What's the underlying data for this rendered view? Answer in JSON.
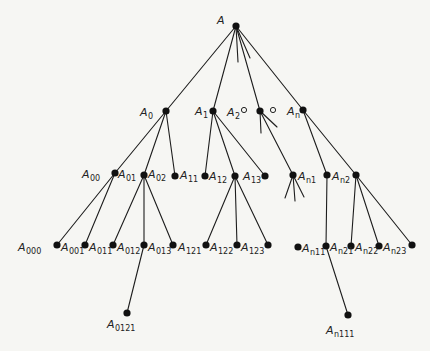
{
  "diagram": {
    "title": "",
    "colors": {
      "ink": "#1d1d1d",
      "node": "#111111",
      "background": "#f6f6f3"
    },
    "nodes": [
      {
        "id": "A",
        "x": 236,
        "y": 26,
        "type": "filled"
      },
      {
        "id": "A0",
        "x": 166,
        "y": 111,
        "type": "filled"
      },
      {
        "id": "A1",
        "x": 213,
        "y": 111,
        "type": "filled"
      },
      {
        "id": "A2-open",
        "x": 244,
        "y": 110,
        "type": "open"
      },
      {
        "id": "A2",
        "x": 260,
        "y": 111,
        "type": "filled"
      },
      {
        "id": "ellipsis-open",
        "x": 273,
        "y": 110,
        "type": "open"
      },
      {
        "id": "An",
        "x": 303,
        "y": 110,
        "type": "filled"
      },
      {
        "id": "A00-A01",
        "x": 115,
        "y": 173,
        "type": "filled"
      },
      {
        "id": "A02",
        "x": 144,
        "y": 175,
        "type": "filled"
      },
      {
        "id": "A11",
        "x": 175,
        "y": 176,
        "type": "filled"
      },
      {
        "id": "A12",
        "x": 205,
        "y": 176,
        "type": "filled"
      },
      {
        "id": "A13",
        "x": 235,
        "y": 176,
        "type": "filled"
      },
      {
        "id": "A14",
        "x": 265,
        "y": 176,
        "type": "filled"
      },
      {
        "id": "An1",
        "x": 293,
        "y": 175,
        "type": "filled"
      },
      {
        "id": "An2a",
        "x": 327,
        "y": 175,
        "type": "filled"
      },
      {
        "id": "An2",
        "x": 356,
        "y": 175,
        "type": "filled"
      },
      {
        "id": "A000",
        "x": 57,
        "y": 245,
        "type": "filled"
      },
      {
        "id": "A001",
        "x": 85,
        "y": 245,
        "type": "filled"
      },
      {
        "id": "A011",
        "x": 113,
        "y": 245,
        "type": "filled"
      },
      {
        "id": "A012",
        "x": 144,
        "y": 245,
        "type": "filled"
      },
      {
        "id": "A013",
        "x": 173,
        "y": 245,
        "type": "filled"
      },
      {
        "id": "A121",
        "x": 206,
        "y": 245,
        "type": "filled"
      },
      {
        "id": "A122",
        "x": 237,
        "y": 245,
        "type": "filled"
      },
      {
        "id": "A123",
        "x": 268,
        "y": 245,
        "type": "filled"
      },
      {
        "id": "An11",
        "x": 298,
        "y": 247,
        "type": "filled"
      },
      {
        "id": "An21",
        "x": 326,
        "y": 246,
        "type": "filled"
      },
      {
        "id": "An22",
        "x": 351,
        "y": 246,
        "type": "filled"
      },
      {
        "id": "An23",
        "x": 379,
        "y": 246,
        "type": "filled"
      },
      {
        "id": "An24",
        "x": 412,
        "y": 245,
        "type": "filled"
      },
      {
        "id": "A0121",
        "x": 127,
        "y": 313,
        "type": "filled"
      },
      {
        "id": "An111",
        "x": 348,
        "y": 315,
        "type": "filled"
      }
    ],
    "edges": [
      [
        236,
        26,
        166,
        111
      ],
      [
        236,
        26,
        213,
        111
      ],
      [
        236,
        26,
        260,
        111
      ],
      [
        236,
        26,
        303,
        110
      ],
      [
        236,
        26,
        238,
        62
      ],
      [
        236,
        26,
        250,
        58
      ],
      [
        166,
        111,
        115,
        173
      ],
      [
        166,
        111,
        144,
        175
      ],
      [
        166,
        111,
        175,
        176
      ],
      [
        213,
        111,
        205,
        176
      ],
      [
        213,
        111,
        235,
        176
      ],
      [
        213,
        111,
        265,
        176
      ],
      [
        260,
        111,
        261,
        133
      ],
      [
        260,
        111,
        277,
        127
      ],
      [
        260,
        111,
        293,
        175
      ],
      [
        303,
        110,
        327,
        175
      ],
      [
        303,
        110,
        356,
        175
      ],
      [
        115,
        173,
        57,
        245
      ],
      [
        115,
        173,
        85,
        245
      ],
      [
        144,
        175,
        113,
        245
      ],
      [
        144,
        175,
        144,
        245
      ],
      [
        144,
        175,
        173,
        245
      ],
      [
        144,
        245,
        127,
        313
      ],
      [
        235,
        176,
        206,
        245
      ],
      [
        235,
        176,
        237,
        245
      ],
      [
        235,
        176,
        268,
        245
      ],
      [
        293,
        175,
        285,
        198
      ],
      [
        293,
        175,
        295,
        201
      ],
      [
        293,
        175,
        304,
        197
      ],
      [
        327,
        175,
        326,
        246
      ],
      [
        326,
        246,
        348,
        315
      ],
      [
        356,
        175,
        351,
        246
      ],
      [
        356,
        175,
        379,
        246
      ],
      [
        356,
        175,
        412,
        245
      ]
    ],
    "labels": [
      {
        "base": "A",
        "sub": "",
        "x": 217,
        "y": 24
      },
      {
        "base": "A",
        "sub": "0",
        "x": 140,
        "y": 116
      },
      {
        "base": "A",
        "sub": "1",
        "x": 195,
        "y": 115
      },
      {
        "base": "A",
        "sub": "2",
        "x": 227,
        "y": 116
      },
      {
        "base": "A",
        "sub": "n",
        "x": 287,
        "y": 115
      },
      {
        "base": "A",
        "sub": "00",
        "x": 82,
        "y": 178
      },
      {
        "base": "A",
        "sub": "01",
        "x": 118,
        "y": 178
      },
      {
        "base": "A",
        "sub": "02",
        "x": 148,
        "y": 178
      },
      {
        "base": "A",
        "sub": "11",
        "x": 180,
        "y": 179
      },
      {
        "base": "A",
        "sub": "12",
        "x": 209,
        "y": 180
      },
      {
        "base": "A",
        "sub": "13",
        "x": 243,
        "y": 180
      },
      {
        "base": "A",
        "sub": "n1",
        "x": 298,
        "y": 180
      },
      {
        "base": "A",
        "sub": "n2",
        "x": 332,
        "y": 180
      },
      {
        "base": "A",
        "sub": "000",
        "x": 18,
        "y": 251
      },
      {
        "base": "A",
        "sub": "001",
        "x": 61,
        "y": 251
      },
      {
        "base": "A",
        "sub": "011",
        "x": 89,
        "y": 251
      },
      {
        "base": "A",
        "sub": "012",
        "x": 117,
        "y": 251
      },
      {
        "base": "A",
        "sub": "013",
        "x": 148,
        "y": 251
      },
      {
        "base": "A",
        "sub": "121",
        "x": 178,
        "y": 251
      },
      {
        "base": "A",
        "sub": "122",
        "x": 210,
        "y": 251
      },
      {
        "base": "A",
        "sub": "123",
        "x": 241,
        "y": 251
      },
      {
        "base": "A",
        "sub": "n11",
        "x": 302,
        "y": 252
      },
      {
        "base": "A",
        "sub": "n21",
        "x": 330,
        "y": 251
      },
      {
        "base": "A",
        "sub": "n22",
        "x": 355,
        "y": 251
      },
      {
        "base": "A",
        "sub": "n23",
        "x": 383,
        "y": 251
      },
      {
        "base": "A",
        "sub": "0121",
        "x": 107,
        "y": 328
      },
      {
        "base": "A",
        "sub": "n111",
        "x": 326,
        "y": 334
      }
    ]
  }
}
